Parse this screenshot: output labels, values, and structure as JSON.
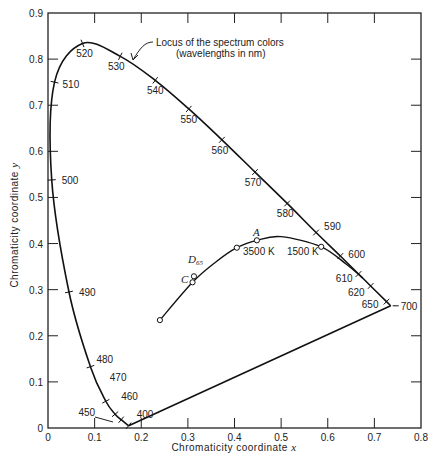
{
  "chart_data": {
    "type": "line",
    "title": "",
    "xlabel": "Chromaticity coordinate x",
    "ylabel": "Chromaticity coordinate y",
    "xlim": [
      0,
      0.8
    ],
    "ylim": [
      0,
      0.9
    ],
    "grid": false,
    "x_ticks": [
      "0",
      "0.1",
      "0.2",
      "0.3",
      "0.4",
      "0.5",
      "0.6",
      "0.7",
      "0.8"
    ],
    "y_ticks": [
      "0",
      "0.1",
      "0.2",
      "0.3",
      "0.4",
      "0.5",
      "0.6",
      "0.7",
      "0.8",
      "0.9"
    ],
    "series": [
      {
        "name": "Spectrum locus",
        "points": [
          {
            "wavelength": 400,
            "x": 0.173,
            "y": 0.005
          },
          {
            "wavelength": 450,
            "x": 0.157,
            "y": 0.018
          },
          {
            "wavelength": 460,
            "x": 0.144,
            "y": 0.03
          },
          {
            "wavelength": 470,
            "x": 0.124,
            "y": 0.058
          },
          {
            "wavelength": 480,
            "x": 0.091,
            "y": 0.133
          },
          {
            "wavelength": 490,
            "x": 0.045,
            "y": 0.295
          },
          {
            "wavelength": 500,
            "x": 0.008,
            "y": 0.538
          },
          {
            "wavelength": 510,
            "x": 0.014,
            "y": 0.75
          },
          {
            "wavelength": 520,
            "x": 0.074,
            "y": 0.834
          },
          {
            "wavelength": 530,
            "x": 0.155,
            "y": 0.806
          },
          {
            "wavelength": 540,
            "x": 0.23,
            "y": 0.754
          },
          {
            "wavelength": 550,
            "x": 0.302,
            "y": 0.692
          },
          {
            "wavelength": 560,
            "x": 0.373,
            "y": 0.625
          },
          {
            "wavelength": 570,
            "x": 0.444,
            "y": 0.555
          },
          {
            "wavelength": 580,
            "x": 0.513,
            "y": 0.487
          },
          {
            "wavelength": 590,
            "x": 0.575,
            "y": 0.424
          },
          {
            "wavelength": 600,
            "x": 0.627,
            "y": 0.373
          },
          {
            "wavelength": 610,
            "x": 0.666,
            "y": 0.334
          },
          {
            "wavelength": 620,
            "x": 0.692,
            "y": 0.308
          },
          {
            "wavelength": 650,
            "x": 0.726,
            "y": 0.274
          },
          {
            "wavelength": 700,
            "x": 0.735,
            "y": 0.265
          }
        ]
      },
      {
        "name": "Blackbody (Planckian) locus",
        "points": [
          {
            "label": "",
            "x": 0.24,
            "y": 0.234
          },
          {
            "label": "C",
            "x": 0.31,
            "y": 0.316
          },
          {
            "label": "D65",
            "x": 0.313,
            "y": 0.329
          },
          {
            "label": "3500 K",
            "x": 0.405,
            "y": 0.391
          },
          {
            "label": "A",
            "x": 0.448,
            "y": 0.407
          },
          {
            "label": "1500 K",
            "x": 0.586,
            "y": 0.393
          }
        ]
      }
    ],
    "annotations": [
      {
        "text": "Locus of the spectrum colors",
        "line2": "(wavelengths in nm)"
      },
      {
        "text": "3500 K"
      },
      {
        "text": "1500 K"
      },
      {
        "text": "A"
      },
      {
        "text": "C"
      },
      {
        "text": "D",
        "subscript": "65"
      }
    ],
    "purple_line": {
      "from_wavelength": 400,
      "to_wavelength": 700
    }
  },
  "labels": {
    "xlabel_text": "Chromaticity coordinate ",
    "xlabel_var": "x",
    "ylabel_text": "Chromaticity coordinate ",
    "ylabel_var": "y",
    "locus_line1": "Locus of the spectrum colors",
    "locus_line2": "(wavelengths in nm)",
    "k3500": "3500 K",
    "k1500": "1500 K",
    "illum_a": "A",
    "illum_c": "C",
    "illum_d": "D",
    "illum_d_sub": "65"
  }
}
